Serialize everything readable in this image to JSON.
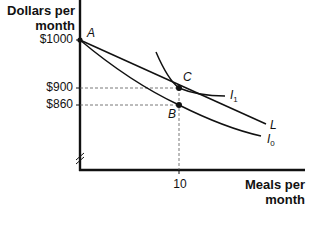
{
  "diagram": {
    "y_axis_label_line1": "Dollars per",
    "y_axis_label_line2": "month",
    "x_axis_label_line1": "Meals per",
    "x_axis_label_line2": "month",
    "y_ticks": [
      "$1000",
      "$900",
      "$860"
    ],
    "x_ticks": [
      "10"
    ],
    "points": {
      "A": "A",
      "B": "B",
      "C": "C"
    },
    "curves": {
      "L": "L",
      "I1": "I",
      "I1_sub": "1",
      "I0": "I",
      "I0_sub": "0"
    }
  }
}
